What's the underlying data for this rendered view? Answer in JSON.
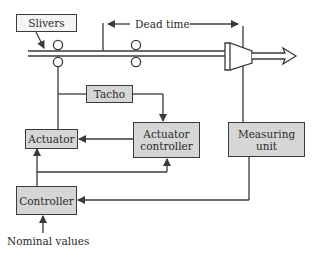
{
  "diagram": {
    "type": "control-loop block diagram",
    "blocks": {
      "slivers": "Slivers",
      "tacho": "Tacho",
      "actuator": "Actuator",
      "actuator_controller": "Actuator controller",
      "measuring_unit": "Measuring unit",
      "controller": "Controller"
    },
    "labels": {
      "dead_time": "Dead time",
      "nominal_values": "Nominal values"
    },
    "colors": {
      "block_fill": "#d6d6d6",
      "line": "#3a3a3a",
      "background": "#ffffff"
    }
  }
}
